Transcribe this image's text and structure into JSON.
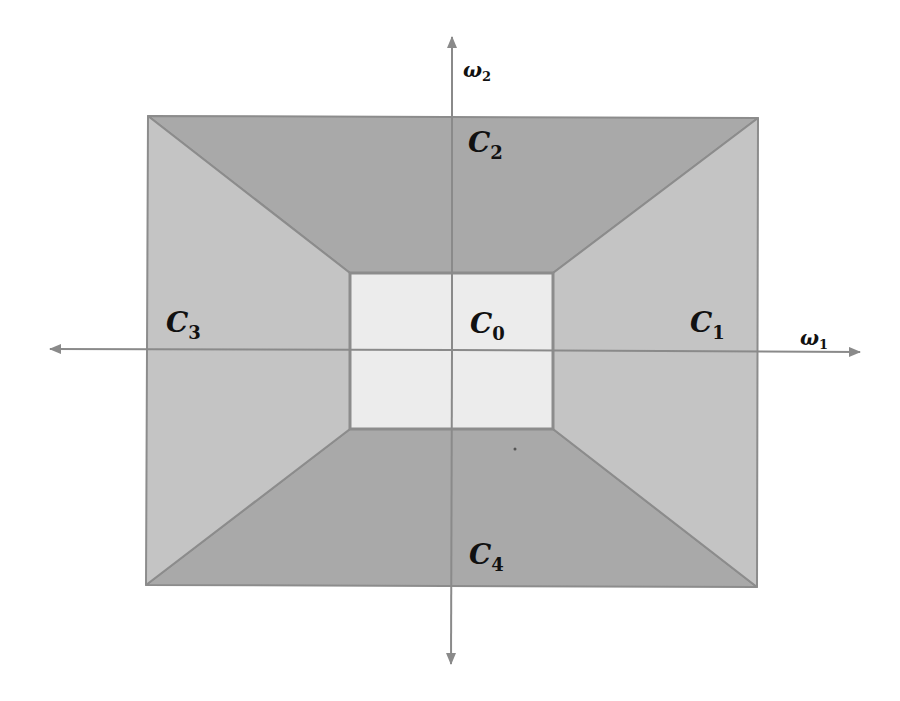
{
  "diagram": {
    "type": "frequency-domain partition",
    "colors": {
      "background": "#ffffff",
      "region_top_bottom": "#a9a9a9",
      "region_sides": "#c4c4c4",
      "region_center": "#ececec",
      "edge": "#8c8c8c",
      "axis": "#8a8a8a",
      "text": "#111111"
    },
    "outer_rect": {
      "x1": 148,
      "y1": 116,
      "x2": 758,
      "y2": 587
    },
    "inner_rect": {
      "x1": 350,
      "y1": 273,
      "x2": 553,
      "y2": 429
    },
    "axes": {
      "horizontal": {
        "label_main": "ω",
        "label_sub": "1",
        "from_x": 50,
        "to_x": 860,
        "y": 350
      },
      "vertical": {
        "label_main": "ω",
        "label_sub": "2",
        "x": 452,
        "from_y": 37,
        "to_y": 664
      }
    },
    "regions": [
      {
        "id": "C0",
        "main": "C",
        "sub": "0",
        "position": "center"
      },
      {
        "id": "C1",
        "main": "C",
        "sub": "1",
        "position": "right"
      },
      {
        "id": "C2",
        "main": "C",
        "sub": "2",
        "position": "top"
      },
      {
        "id": "C3",
        "main": "C",
        "sub": "3",
        "position": "left"
      },
      {
        "id": "C4",
        "main": "C",
        "sub": "4",
        "position": "bottom"
      }
    ]
  }
}
